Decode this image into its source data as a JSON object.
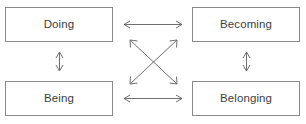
{
  "diagram": {
    "canvas": {
      "width": 306,
      "height": 124
    },
    "style": {
      "box_border_color": "#8a8a8a",
      "box_fill_color": "#ffffff",
      "label_color": "#3d3d3d",
      "arrow_color": "#6f6f6f",
      "background_color": "#ffffff"
    },
    "nodes": [
      {
        "id": "doing",
        "label": "Doing",
        "position": "top-left"
      },
      {
        "id": "becoming",
        "label": "Becoming",
        "position": "top-right"
      },
      {
        "id": "being",
        "label": "Being",
        "position": "bottom-left"
      },
      {
        "id": "belonging",
        "label": "Belonging",
        "position": "bottom-right"
      }
    ],
    "connectors": [
      {
        "id": "doing-becoming",
        "from": "doing",
        "to": "becoming",
        "type": "double-headed-arrow",
        "orientation": "horizontal"
      },
      {
        "id": "being-belonging",
        "from": "being",
        "to": "belonging",
        "type": "double-headed-arrow",
        "orientation": "horizontal"
      },
      {
        "id": "doing-being",
        "from": "doing",
        "to": "being",
        "type": "double-headed-arrow",
        "orientation": "vertical"
      },
      {
        "id": "becoming-belonging",
        "from": "becoming",
        "to": "belonging",
        "type": "double-headed-arrow",
        "orientation": "vertical"
      },
      {
        "id": "doing-belonging",
        "from": "doing",
        "to": "belonging",
        "type": "double-headed-arrow",
        "orientation": "diagonal"
      },
      {
        "id": "becoming-being",
        "from": "becoming",
        "to": "being",
        "type": "double-headed-arrow",
        "orientation": "diagonal"
      }
    ]
  }
}
